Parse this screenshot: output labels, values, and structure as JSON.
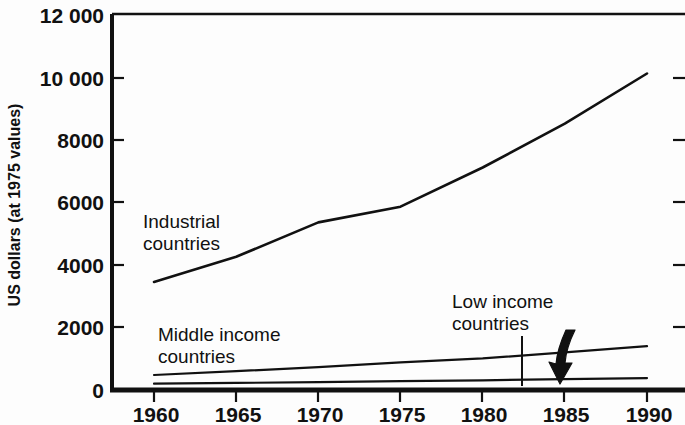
{
  "chart_data": {
    "type": "line",
    "title": "",
    "xlabel": "",
    "ylabel": "US dollars (at 1975 values)",
    "xlim": [
      1958,
      1992
    ],
    "ylim": [
      0,
      12000
    ],
    "grid": false,
    "legend_position": "inline-annotations",
    "x_ticks": [
      "1960",
      "1965",
      "1970",
      "1975",
      "1980",
      "1985",
      "1990"
    ],
    "x_tick_values": [
      1960,
      1965,
      1970,
      1975,
      1980,
      1985,
      1990
    ],
    "y_ticks": [
      "0",
      "2000",
      "4000",
      "6000",
      "8000",
      "10 000",
      "12 000"
    ],
    "y_tick_values": [
      0,
      2000,
      4000,
      6000,
      8000,
      10000,
      12000
    ],
    "x": [
      1960,
      1965,
      1970,
      1975,
      1980,
      1985,
      1990
    ],
    "series": [
      {
        "name": "Industrial countries",
        "label_line1": "Industrial",
        "label_line2": "countries",
        "values": [
          3450,
          4250,
          5350,
          5850,
          7100,
          8500,
          10100
        ],
        "stroke_width": 2.6
      },
      {
        "name": "Middle income countries",
        "label_line1": "Middle income",
        "label_line2": "countries",
        "values": [
          480,
          600,
          730,
          880,
          1010,
          1200,
          1400
        ],
        "stroke_width": 2.2
      },
      {
        "name": "Low income countries",
        "label_line1": "Low income",
        "label_line2": "countries",
        "values": [
          200,
          225,
          250,
          280,
          310,
          345,
          380
        ],
        "stroke_width": 2.2
      }
    ],
    "annotations": [
      {
        "name": "low-income-callout",
        "text_line1": "Low income",
        "text_line2": "countries",
        "leader": "vertical-line",
        "arrow": "curved-down-arrow"
      }
    ],
    "colors": {
      "line": "#111111",
      "axis": "#111111",
      "background": "#fdfdfd",
      "text": "#111111"
    }
  }
}
